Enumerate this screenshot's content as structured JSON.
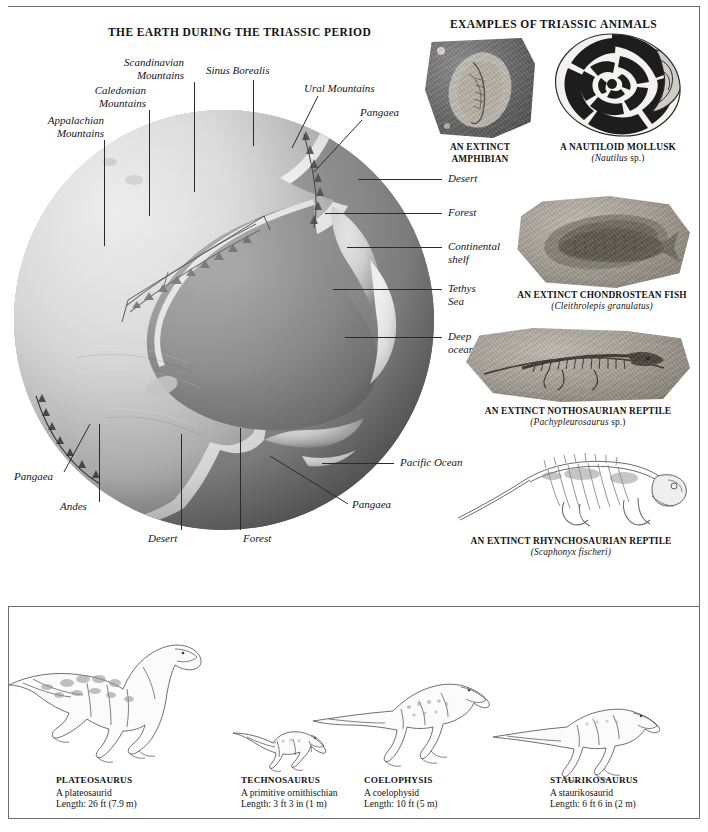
{
  "page": {
    "title_main": "THE EARTH DURING THE TRIASSIC PERIOD",
    "title_animals": "EXAMPLES OF TRIASSIC ANIMALS"
  },
  "globe_labels": [
    {
      "id": "appalachian-mountains",
      "text": "Appalachian\nMountains"
    },
    {
      "id": "caledonian-mountains",
      "text": "Caledonian\nMountains"
    },
    {
      "id": "scandinavian-mountains",
      "text": "Scandinavian\nMountains"
    },
    {
      "id": "sinus-borealis",
      "text": "Sinus Borealis"
    },
    {
      "id": "ural-mountains",
      "text": "Ural Mountains"
    },
    {
      "id": "pangaea-top",
      "text": "Pangaea"
    },
    {
      "id": "desert-right",
      "text": "Desert"
    },
    {
      "id": "forest-right",
      "text": "Forest"
    },
    {
      "id": "continental-shelf",
      "text": "Continental\nshelf"
    },
    {
      "id": "tethys-sea",
      "text": "Tethys\nSea"
    },
    {
      "id": "deep-ocean",
      "text": "Deep\nocean"
    },
    {
      "id": "pacific-ocean",
      "text": "Pacific Ocean"
    },
    {
      "id": "pangaea-right",
      "text": "Pangaea"
    },
    {
      "id": "pangaea-left",
      "text": "Pangaea"
    },
    {
      "id": "andes",
      "text": "Andes"
    },
    {
      "id": "desert-bottom",
      "text": "Desert"
    },
    {
      "id": "forest-bottom",
      "text": "Forest"
    }
  ],
  "fossils": [
    {
      "id": "extinct-amphibian",
      "caption": "AN EXTINCT AMPHIBIAN",
      "species": ""
    },
    {
      "id": "nautiloid-mollusk",
      "caption": "A NAUTILOID MOLLUSK",
      "species": "(Nautilus",
      "species_suffix": " sp.)"
    },
    {
      "id": "chondrostean-fish",
      "caption": "AN EXTINCT CHONDROSTEAN FISH",
      "species": "(Cleithrolepis granulatus)"
    },
    {
      "id": "nothosaurian-reptile",
      "caption": "AN EXTINCT NOTHOSAURIAN REPTILE",
      "species": "(Pachypleurosaurus",
      "species_suffix": " sp.)"
    },
    {
      "id": "rhynchosaurian-reptile",
      "caption": "AN EXTINCT RHYNCHOSAURIAN REPTILE",
      "species": "(Scaphonyx fischeri)"
    }
  ],
  "dinosaurs": [
    {
      "id": "plateosaurus",
      "name": "PLATEOSAURUS",
      "group": "A plateosaurid",
      "length": "Length: 26 ft (7.9 m)"
    },
    {
      "id": "technosaurus",
      "name": "TECHNOSAURUS",
      "group": "A primitive ornithischian",
      "length": "Length: 3 ft 3 in (1 m)"
    },
    {
      "id": "coelophysis",
      "name": "COELOPHYSIS",
      "group": "A coelophysid",
      "length": "Length: 10 ft (5 m)"
    },
    {
      "id": "staurikosaurus",
      "name": "STAURIKOSAURUS",
      "group": "A staurikosaurid",
      "length": "Length: 6 ft 6 in (2 m)"
    }
  ],
  "colors": {
    "ink": "#141414",
    "leader": "#2b2b2b",
    "ocean": "#8c8c8c",
    "land": "#d8d8d8",
    "shelf": "#f2f2f2",
    "rule": "#6e6e6e"
  }
}
